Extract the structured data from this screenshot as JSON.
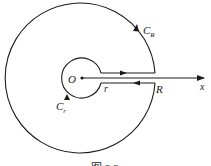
{
  "figure": {
    "type": "contour-diagram",
    "labels": {
      "origin": "O",
      "inner_radius": "r",
      "outer_radius": "R",
      "outer_contour": "C",
      "outer_contour_sub": "R",
      "inner_contour": "C",
      "inner_contour_sub": "r",
      "axis": "x"
    },
    "caption": "图 3.3",
    "colors": {
      "stroke": "#1a1a1a",
      "background": "#ffffff"
    }
  }
}
